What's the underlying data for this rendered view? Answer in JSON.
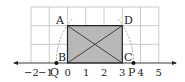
{
  "diagram": {
    "type": "geometry-number-line",
    "number_line": {
      "ticks": [
        {
          "value": -2,
          "label": "−2"
        },
        {
          "value": -1,
          "label": "−1"
        },
        {
          "value": 0,
          "label": "0"
        },
        {
          "value": 1,
          "label": "1"
        },
        {
          "value": 2,
          "label": "2"
        },
        {
          "value": 3,
          "label": "3"
        },
        {
          "value": 4,
          "label": "4"
        },
        {
          "value": 5,
          "label": "5"
        }
      ]
    },
    "rectangle": {
      "vertices": [
        {
          "name": "A",
          "label": "A",
          "x": 0,
          "y": 2
        },
        {
          "name": "B",
          "label": "B",
          "x": 0,
          "y": 0
        },
        {
          "name": "C",
          "label": "C",
          "x": 3,
          "y": 0
        },
        {
          "name": "D",
          "label": "D",
          "x": 3,
          "y": 2
        }
      ],
      "fill": "#b8b8b8",
      "diagonals": [
        "AC",
        "BD"
      ]
    },
    "points": [
      {
        "name": "Q",
        "label": "Q",
        "x": -0.61
      },
      {
        "name": "P",
        "label": "P",
        "x": 3.61
      }
    ],
    "arcs": [
      {
        "center": "C",
        "through": "A",
        "to": "Q"
      },
      {
        "center": "B",
        "through": "D",
        "to": "P"
      }
    ]
  }
}
